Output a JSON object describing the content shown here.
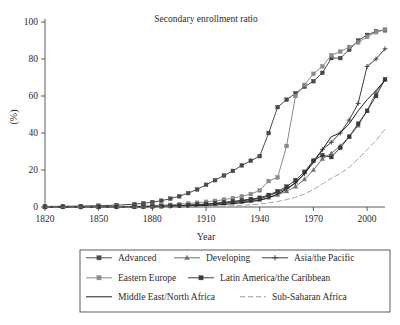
{
  "chart_data": {
    "type": "line",
    "title": "Secondary enrollment ratio",
    "xlabel": "Year",
    "ylabel": "(%)",
    "xlim": [
      1820,
      2010
    ],
    "ylim": [
      0,
      100
    ],
    "grid": false,
    "legend_position": "bottom",
    "xticks": [
      "1820",
      "1850",
      "1880",
      "1910",
      "1940",
      "1970",
      "2000"
    ],
    "xtick_values": [
      1820,
      1850,
      1880,
      1910,
      1940,
      1970,
      2000
    ],
    "yticks": [
      "0",
      "20",
      "40",
      "60",
      "80",
      "100"
    ],
    "ytick_values": [
      0,
      20,
      40,
      60,
      80,
      100
    ],
    "x": [
      1820,
      1830,
      1840,
      1850,
      1860,
      1870,
      1875,
      1880,
      1885,
      1890,
      1895,
      1900,
      1905,
      1910,
      1915,
      1920,
      1925,
      1930,
      1935,
      1940,
      1945,
      1950,
      1955,
      1960,
      1965,
      1970,
      1975,
      1980,
      1985,
      1990,
      1995,
      2000,
      2005,
      2010
    ],
    "series": [
      {
        "name": "Advanced",
        "color": "#4a4a4a",
        "marker": "square",
        "dash": "none",
        "values": [
          0.3,
          0.4,
          0.5,
          0.7,
          1.0,
          1.5,
          2.0,
          2.6,
          3.4,
          4.5,
          5.8,
          7.5,
          9.5,
          12.0,
          14.5,
          17.0,
          19.5,
          22.5,
          25.0,
          27.5,
          40.0,
          54.0,
          58.0,
          61.5,
          65.0,
          68.0,
          72.5,
          80.5,
          80.5,
          85.0,
          90.0,
          93.0,
          95.0,
          95.5
        ]
      },
      {
        "name": "Developing",
        "color": "#6e6e6e",
        "marker": "triangle",
        "dash": "none",
        "values": [
          0.05,
          0.05,
          0.06,
          0.08,
          0.1,
          0.15,
          0.2,
          0.3,
          0.4,
          0.5,
          0.7,
          0.9,
          1.1,
          1.4,
          1.7,
          2.0,
          2.4,
          2.8,
          3.2,
          3.8,
          5.0,
          6.5,
          8.5,
          11.0,
          15.0,
          20.0,
          26.0,
          29.0,
          33.0,
          38.0,
          44.0,
          52.0,
          62.0,
          69.0
        ]
      },
      {
        "name": "Asia/the Pacific",
        "color": "#3a3a3a",
        "marker": "plus",
        "dash": "none",
        "values": [
          0.05,
          0.05,
          0.06,
          0.08,
          0.1,
          0.15,
          0.2,
          0.3,
          0.4,
          0.5,
          0.7,
          0.9,
          1.2,
          1.5,
          1.9,
          2.3,
          2.8,
          3.3,
          3.9,
          4.5,
          6.0,
          8.0,
          10.0,
          13.0,
          18.0,
          25.0,
          31.0,
          35.0,
          40.0,
          47.0,
          56.0,
          76.0,
          80.0,
          85.5
        ]
      },
      {
        "name": "Eastern Europe",
        "color": "#8a8a8a",
        "marker": "square",
        "dash": "none",
        "values": [
          0.1,
          0.12,
          0.15,
          0.2,
          0.3,
          0.4,
          0.5,
          0.7,
          0.9,
          1.2,
          1.5,
          1.9,
          2.3,
          2.8,
          3.3,
          4.0,
          4.8,
          5.8,
          7.0,
          9.0,
          14.0,
          16.0,
          33.0,
          60.0,
          66.0,
          72.0,
          76.0,
          82.0,
          84.0,
          86.5,
          89.0,
          92.0,
          94.5,
          96.0
        ]
      },
      {
        "name": "Latin America/the Caribbean",
        "color": "#3a3a3a",
        "marker": "square",
        "dash": "none",
        "values": [
          0.05,
          0.06,
          0.07,
          0.1,
          0.12,
          0.18,
          0.25,
          0.35,
          0.45,
          0.6,
          0.8,
          1.0,
          1.3,
          1.6,
          2.0,
          2.5,
          3.0,
          3.6,
          4.3,
          5.0,
          6.5,
          8.5,
          11.0,
          14.5,
          19.0,
          25.0,
          28.0,
          27.0,
          32.0,
          38.0,
          45.0,
          52.0,
          60.0,
          69.0
        ]
      },
      {
        "name": "Middle East/North Africa",
        "color": "#1f1f1f",
        "marker": "none",
        "dash": "none",
        "values": [
          0.02,
          0.02,
          0.03,
          0.04,
          0.05,
          0.08,
          0.1,
          0.15,
          0.2,
          0.28,
          0.37,
          0.5,
          0.65,
          0.85,
          1.1,
          1.4,
          1.8,
          2.3,
          2.9,
          3.6,
          5.0,
          7.0,
          9.5,
          13.0,
          18.0,
          24.0,
          31.0,
          38.0,
          40.0,
          45.0,
          52.0,
          58.0,
          63.0,
          68.5
        ]
      },
      {
        "name": "Sub-Saharan Africa",
        "color": "#9a9a9a",
        "marker": "none",
        "dash": "dashed",
        "values": [
          0.01,
          0.01,
          0.01,
          0.02,
          0.02,
          0.03,
          0.04,
          0.05,
          0.07,
          0.1,
          0.13,
          0.17,
          0.22,
          0.3,
          0.4,
          0.5,
          0.7,
          0.9,
          1.2,
          1.6,
          2.2,
          3.0,
          4.0,
          5.2,
          7.0,
          9.5,
          12.5,
          15.5,
          18.0,
          21.5,
          26.0,
          31.0,
          36.0,
          42.0
        ]
      }
    ]
  },
  "legend": {
    "rows": [
      [
        {
          "label": "Advanced",
          "series": 0
        },
        {
          "label": "Developing",
          "series": 1
        },
        {
          "label": "Asia/the Pacific",
          "series": 2
        }
      ],
      [
        {
          "label": "Eastern Europe",
          "series": 3
        },
        {
          "label": "Latin America/the Caribbean",
          "series": 4
        }
      ],
      [
        {
          "label": "Middle East/North Africa",
          "series": 5
        },
        {
          "label": "Sub-Saharan Africa",
          "series": 6
        }
      ]
    ]
  }
}
